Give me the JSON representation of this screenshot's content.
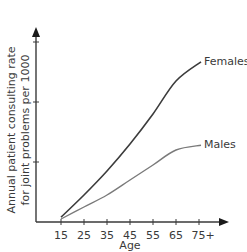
{
  "chart_data": {
    "type": "line",
    "title": "",
    "xlabel": "Age",
    "ylabel": "Annual patient consulting rate for joint problems per 1000",
    "ylabel_lines": [
      "Annual patient consulting rate",
      "for joint problems per 1000"
    ],
    "categories": [
      "15",
      "25",
      "35",
      "45",
      "55",
      "65",
      "75+"
    ],
    "x_tick_labels": [
      "15",
      "25",
      "35",
      "45",
      "55",
      "65",
      "75+"
    ],
    "y_tick_labels": [],
    "y_ticks_unlabeled": 3,
    "ylim": [
      0,
      3.2
    ],
    "grid": false,
    "legend": "inline labels at line ends",
    "series": [
      {
        "name": "Females",
        "color": "#3c3c3c",
        "values": [
          0.08,
          0.45,
          0.85,
          1.3,
          1.8,
          2.35,
          2.67
        ]
      },
      {
        "name": "Males",
        "color": "#7a7a7a",
        "values": [
          0.05,
          0.25,
          0.45,
          0.7,
          0.95,
          1.2,
          1.28
        ]
      }
    ],
    "annotations": [
      "Females",
      "Males"
    ]
  }
}
